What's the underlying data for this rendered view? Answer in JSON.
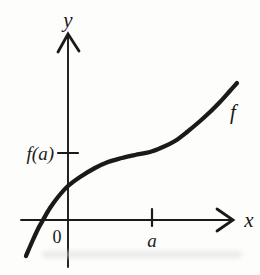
{
  "figure": {
    "kind": "textbook-function-graph",
    "background_color": "#fdfdfc",
    "ink_color": "#1a1a1a"
  },
  "labels": {
    "y_axis": "y",
    "x_axis": "x",
    "origin": "0",
    "a": "a",
    "f_of_a": "f(a)",
    "f": "f"
  },
  "chart_data": {
    "type": "line",
    "title": "",
    "xlabel": "x",
    "ylabel": "y",
    "legend": "none",
    "grid": false,
    "curve_label": "f",
    "x_tick_labels": [
      "0",
      "a"
    ],
    "y_tick_labels": [
      "f(a)"
    ],
    "axes_px": {
      "origin": [
        68,
        220
      ],
      "y_axis_top": [
        68,
        34
      ],
      "y_axis_bottom": [
        68,
        267
      ],
      "x_axis_left": [
        21,
        220
      ],
      "x_axis_right": [
        233,
        220
      ],
      "a_tick_x": 152,
      "f_of_a_tick_y": 153
    },
    "curve_points_px": [
      [
        26,
        256
      ],
      [
        32,
        242
      ],
      [
        38,
        229
      ],
      [
        43,
        220
      ],
      [
        50,
        208
      ],
      [
        58,
        197
      ],
      [
        68,
        186
      ],
      [
        80,
        177
      ],
      [
        95,
        168
      ],
      [
        108,
        162
      ],
      [
        122,
        158
      ],
      [
        135,
        155
      ],
      [
        150,
        152
      ],
      [
        163,
        147
      ],
      [
        175,
        141
      ],
      [
        187,
        132
      ],
      [
        199,
        122
      ],
      [
        210,
        112
      ],
      [
        220,
        102
      ],
      [
        229,
        92
      ],
      [
        237,
        83
      ]
    ]
  }
}
